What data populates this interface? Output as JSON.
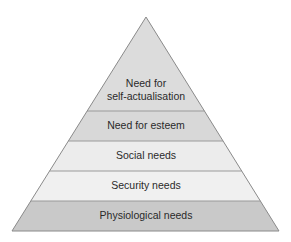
{
  "diagram": {
    "type": "pyramid",
    "apex": {
      "x": 146,
      "y": 17
    },
    "base": {
      "left": 12,
      "right": 279,
      "y": 231
    },
    "edge_color": "#8a8a8a",
    "divider_color": "#9a9a9a",
    "layers": [
      {
        "id": "self-actualisation",
        "lines": [
          "Need for",
          "self-actualisation"
        ],
        "top": 17,
        "bottom": 111,
        "fill": "#dcdcdc",
        "text_y": [
          84,
          97
        ]
      },
      {
        "id": "esteem",
        "lines": [
          "Need for esteem"
        ],
        "top": 111,
        "bottom": 141,
        "fill": "#d8d8d8",
        "text_y": [
          126
        ]
      },
      {
        "id": "social",
        "lines": [
          "Social needs"
        ],
        "top": 141,
        "bottom": 171,
        "fill": "#ececec",
        "text_y": [
          156
        ]
      },
      {
        "id": "security",
        "lines": [
          "Security needs"
        ],
        "top": 171,
        "bottom": 201,
        "fill": "#f0f0f0",
        "text_y": [
          186
        ]
      },
      {
        "id": "physiological",
        "lines": [
          "Physiological needs"
        ],
        "top": 201,
        "bottom": 231,
        "fill": "#c9c9c9",
        "text_y": [
          216
        ]
      }
    ]
  }
}
